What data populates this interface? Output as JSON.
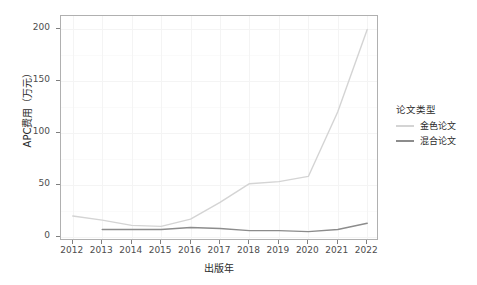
{
  "chart_data": {
    "type": "line",
    "title": "",
    "xlabel": "出版年",
    "ylabel": "APC费用（万元）",
    "x": [
      2012,
      2013,
      2014,
      2015,
      2016,
      2017,
      2018,
      2019,
      2020,
      2021,
      2022
    ],
    "categories": [
      "2012",
      "2013",
      "2014",
      "2015",
      "2016",
      "2017",
      "2018",
      "2019",
      "2020",
      "2021",
      "2022"
    ],
    "series": [
      {
        "name": "金色论文",
        "color": "#d4d4d4",
        "values": [
          20,
          16,
          11,
          10,
          17,
          33,
          51,
          53,
          58,
          120,
          199
        ]
      },
      {
        "name": "混合论文",
        "color": "#8c8c8c",
        "values": [
          null,
          7,
          7,
          7,
          9,
          8,
          6,
          6,
          5,
          7,
          13
        ]
      }
    ],
    "xlim": [
      2011.6,
      2022.4
    ],
    "ylim": [
      -4,
      212
    ],
    "yticks": [
      0,
      50,
      100,
      150,
      200
    ],
    "ytick_labels": [
      "0",
      "50",
      "100",
      "150",
      "200"
    ],
    "xticks": [
      2012,
      2013,
      2014,
      2015,
      2016,
      2017,
      2018,
      2019,
      2020,
      2021,
      2022
    ],
    "xtick_labels": [
      "2012",
      "2013",
      "2014",
      "2015",
      "2016",
      "2017",
      "2018",
      "2019",
      "2020",
      "2021",
      "2022"
    ],
    "grid": true,
    "legend_position": "right",
    "legend": {
      "title": "论文类型",
      "entries": [
        {
          "label": "金色论文",
          "color": "#d4d4d4"
        },
        {
          "label": "混合论文",
          "color": "#8c8c8c"
        }
      ]
    }
  }
}
